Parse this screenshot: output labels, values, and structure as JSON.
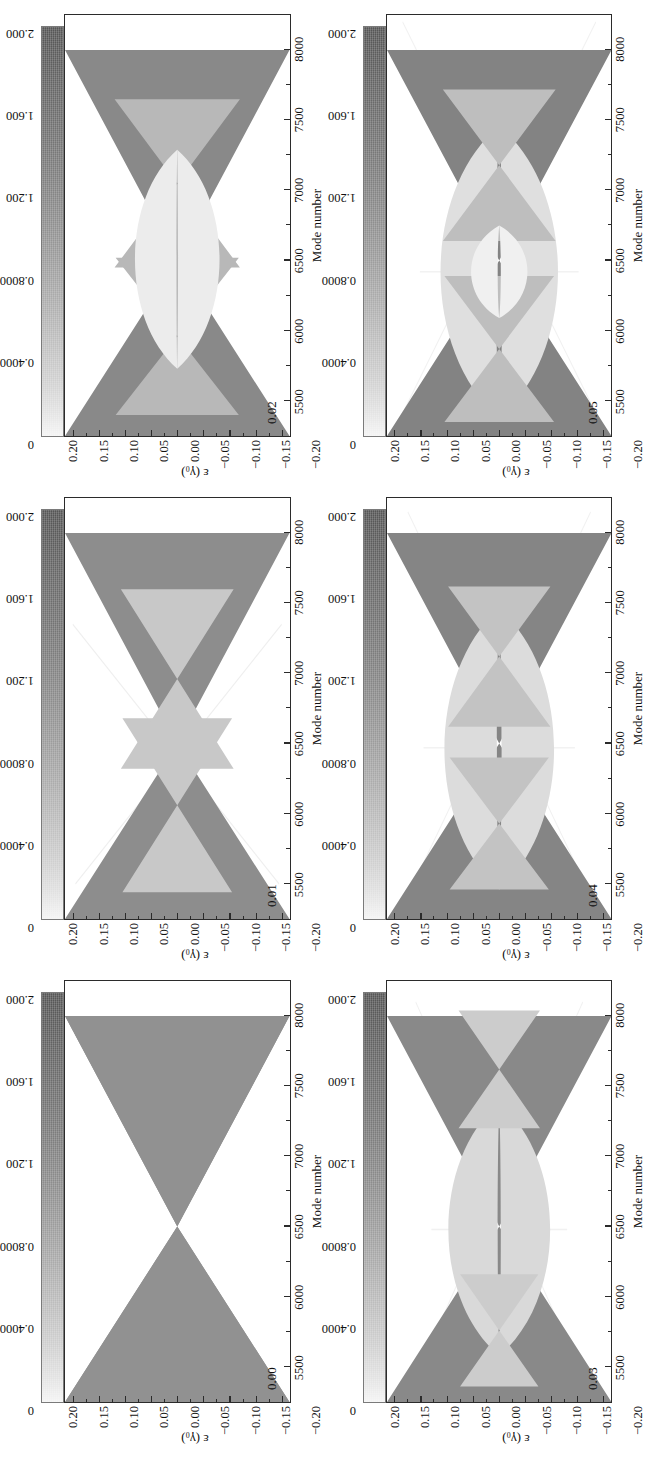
{
  "figure": {
    "rotation_note": "figure rendered rotated 90 degrees counter-clockwise",
    "xlabel": "Mode number",
    "ylabel": "ε (γ₀)",
    "xticks": [
      "5500",
      "6000",
      "6500",
      "7000",
      "7500",
      "8000"
    ],
    "xtick_values": [
      5500,
      6000,
      6500,
      7000,
      7500,
      8000
    ],
    "xlim": [
      5250,
      8250
    ],
    "yticks": [
      "0.20",
      "0.15",
      "0.10",
      "0.05",
      "0.00",
      "−0.05",
      "−0.10",
      "−0.15",
      "−0.20"
    ],
    "ytick_values": [
      0.2,
      0.15,
      0.1,
      0.05,
      0.0,
      -0.05,
      -0.1,
      -0.15,
      -0.2
    ],
    "ylim": [
      -0.215,
      0.215
    ],
    "colorbar": {
      "ticks": [
        "0",
        "0.4000",
        "0.8000",
        "1.200",
        "1.600",
        "2.000"
      ],
      "tick_values": [
        0,
        0.4,
        0.8,
        1.2,
        1.6,
        2.0
      ],
      "vmin": 0,
      "vmax": 2.0,
      "low_color": "#f4f4f4",
      "high_color": "#555555"
    }
  },
  "chart_data": {
    "type": "heatmap",
    "title": "",
    "xlabel": "Mode number",
    "ylabel": "ε (γ₀)",
    "xlim": [
      5250,
      8250
    ],
    "ylim": [
      -0.215,
      0.215
    ],
    "grid": false,
    "legend": "colorbar right of each panel",
    "colormap": "grayscale, light = 0, dark = 2.000",
    "cbar_range": [
      0,
      2.0
    ],
    "cbar_ticks": [
      0,
      0.4,
      0.8,
      1.2,
      1.6,
      2.0
    ],
    "panels": [
      {
        "tag": "0.00",
        "strain": 0.0,
        "description": "Single X-shaped (bow-tie) band crossing at mode 6500, epsilon 0; linear edges from (5500,+0.20)/(5500,-0.20) converging to the node and re-opening toward (8000,+0.11)/(8000,-0.11).",
        "nodes": [
          {
            "mode": 6500,
            "eps": 0.0
          }
        ],
        "bands": 1
      },
      {
        "tag": "0.01",
        "strain": 0.01,
        "description": "Primary X at mode 6500 plus weak secondary crossings near modes 6000 and 7000; small gaps open near epsilon +/-0.15.",
        "nodes": [
          {
            "mode": 6500,
            "eps": 0.0
          },
          {
            "mode": 6050,
            "eps": 0.0
          },
          {
            "mode": 6950,
            "eps": 0.0
          }
        ],
        "bands": 3
      },
      {
        "tag": "0.02",
        "strain": 0.02,
        "description": "Central X at mode 6500 with two lens-shaped gaps opening above and below; replica crossings near modes 5950 and 7050 and faint outer lines reaching mode 7700.",
        "nodes": [
          {
            "mode": 6500,
            "eps": 0.0
          },
          {
            "mode": 5950,
            "eps": 0.0
          },
          {
            "mode": 7050,
            "eps": 0.0
          }
        ],
        "bands": 3
      },
      {
        "tag": "0.03",
        "strain": 0.03,
        "description": "Broad light-gray lobes above and below the node at mode 6500; dark V-shaped bands at the left and right, plus faint diagonal replicas crossing near mode 7600.",
        "nodes": [
          {
            "mode": 6500,
            "eps": 0.0
          },
          {
            "mode": 5750,
            "eps": 0.0
          },
          {
            "mode": 7600,
            "eps": 0.0
          }
        ],
        "bands": 5
      },
      {
        "tag": "0.04",
        "strain": 0.04,
        "description": "Pronounced light lobes with an inner vertical gap at mode 6500; dark wedge bands at both edges and double crossings near modes 5900 and 7100.",
        "nodes": [
          {
            "mode": 6500,
            "eps": 0.0
          },
          {
            "mode": 5900,
            "eps": 0.0
          },
          {
            "mode": 7100,
            "eps": 0.0
          }
        ],
        "bands": 5
      },
      {
        "tag": "0.05",
        "strain": 0.05,
        "description": "Strongest splitting: two bright lobes separated by a narrow vertical channel at mode 6500, dark outer wedges, extra crossings near modes 5850 and 7150 and faint lines out to mode 8000.",
        "nodes": [
          {
            "mode": 6500,
            "eps": 0.0
          },
          {
            "mode": 5850,
            "eps": 0.0
          },
          {
            "mode": 7150,
            "eps": 0.0
          }
        ],
        "bands": 7
      }
    ]
  },
  "panels": [
    {
      "tag": "0.00"
    },
    {
      "tag": "0.01"
    },
    {
      "tag": "0.02"
    },
    {
      "tag": "0.03"
    },
    {
      "tag": "0.04"
    },
    {
      "tag": "0.05"
    }
  ]
}
